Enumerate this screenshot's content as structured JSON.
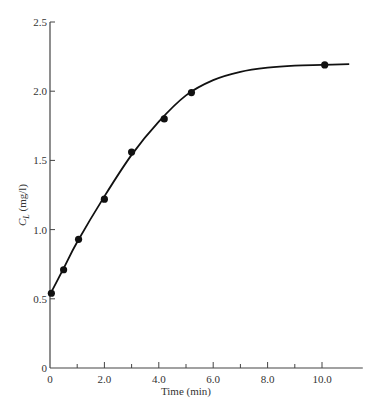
{
  "chart_data": {
    "type": "line",
    "title": "",
    "xlabel": "Time (min)",
    "ylabel": "C_L (mg/l)",
    "ylabel_main": "C",
    "ylabel_sub": "L",
    "ylabel_rest": " (mg/l)",
    "xlim": [
      0,
      11
    ],
    "ylim": [
      0,
      2.5
    ],
    "grid": false,
    "legend": null,
    "x_ticks_major": [
      0,
      2.0,
      4.0,
      6.0,
      8.0,
      10.0
    ],
    "x_tick_labels": [
      "0",
      "2.0",
      "4.0",
      "6.0",
      "8.0",
      "10.0"
    ],
    "x_ticks_minor": [
      1,
      3,
      5,
      7,
      9
    ],
    "y_ticks": [
      0,
      0.5,
      1.0,
      1.5,
      2.0,
      2.5
    ],
    "y_tick_labels": [
      "0",
      "0.5",
      "1.0",
      "1.5",
      "2.0",
      "2.5"
    ],
    "series": [
      {
        "name": "measured",
        "kind": "scatter",
        "x": [
          0.05,
          0.5,
          1.05,
          2.0,
          3.0,
          4.2,
          5.2,
          10.1
        ],
        "y": [
          0.54,
          0.71,
          0.93,
          1.22,
          1.56,
          1.8,
          1.99,
          2.19
        ]
      },
      {
        "name": "fitted curve",
        "kind": "line",
        "x": [
          0,
          0.5,
          1,
          2,
          3,
          4,
          5,
          6,
          7,
          8,
          9,
          10,
          11
        ],
        "y": [
          0.53,
          0.72,
          0.91,
          1.24,
          1.54,
          1.78,
          1.97,
          2.08,
          2.14,
          2.17,
          2.185,
          2.19,
          2.195
        ]
      }
    ]
  }
}
